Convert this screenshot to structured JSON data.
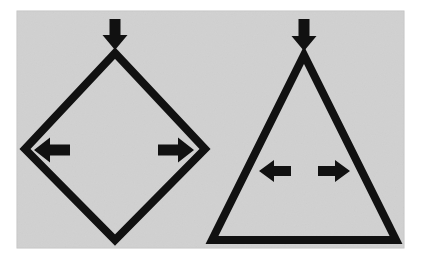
{
  "figure": {
    "title": "Two outlined geometric shapes with force-direction arrows",
    "canvas": {
      "width": 423,
      "height": 262
    },
    "colors": {
      "page_background": "#ffffff",
      "panel_background": "#d4d4d4",
      "panel_background_noise": "#cfcfcf",
      "panel_border": "#c2c2c2",
      "ink": "#111111",
      "stroke": "#111111"
    },
    "panel": {
      "name": "gray-photo-panel",
      "x": 17,
      "y": 11,
      "width": 387,
      "height": 237
    },
    "shapes": [
      {
        "id": "diamond",
        "label": "Diamond (square rotated 45 degrees)",
        "kind": "diamond",
        "stroke_width": 8,
        "center": {
          "x": 115,
          "y": 146
        },
        "vertices": [
          {
            "x": 115,
            "y": 53
          },
          {
            "x": 205,
            "y": 149
          },
          {
            "x": 115,
            "y": 240
          },
          {
            "x": 25,
            "y": 149
          }
        ],
        "top_arrow": {
          "name": "down-arrow-diamond",
          "direction": "down",
          "shaft_center_x": 115,
          "shaft_top_y": 19,
          "tip_y": 50,
          "shaft_width": 11,
          "head_width": 25,
          "head_height": 15
        },
        "inner_arrows": [
          {
            "name": "left-arrow-diamond",
            "direction": "left",
            "tip": {
              "x": 34,
              "y": 150
            },
            "tail_x": 70,
            "center_y": 150,
            "shaft_height": 11,
            "head_width": 16,
            "head_height": 25
          },
          {
            "name": "right-arrow-diamond",
            "direction": "right",
            "tip": {
              "x": 194,
              "y": 150
            },
            "tail_x": 158,
            "center_y": 150,
            "shaft_height": 11,
            "head_width": 16,
            "head_height": 25
          }
        ]
      },
      {
        "id": "triangle",
        "label": "Equilateral triangle, apex up",
        "kind": "triangle",
        "stroke_width": 8,
        "center": {
          "x": 304,
          "y": 178
        },
        "vertices": [
          {
            "x": 304,
            "y": 55
          },
          {
            "x": 396,
            "y": 240
          },
          {
            "x": 212,
            "y": 240
          }
        ],
        "top_arrow": {
          "name": "down-arrow-triangle",
          "direction": "down",
          "shaft_center_x": 304,
          "shaft_top_y": 19,
          "tip_y": 51,
          "shaft_width": 11,
          "head_width": 25,
          "head_height": 15
        },
        "inner_arrows": [
          {
            "name": "left-arrow-triangle",
            "direction": "left",
            "tip": {
              "x": 259,
              "y": 171
            },
            "tail_x": 291,
            "center_y": 171,
            "shaft_height": 10,
            "head_width": 15,
            "head_height": 22
          },
          {
            "name": "right-arrow-triangle",
            "direction": "right",
            "tip": {
              "x": 350,
              "y": 171
            },
            "tail_x": 318,
            "center_y": 171,
            "shaft_height": 10,
            "head_width": 15,
            "head_height": 22
          }
        ]
      }
    ]
  }
}
